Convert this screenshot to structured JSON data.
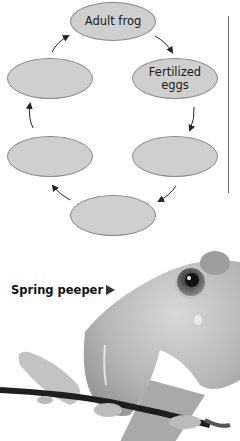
{
  "diagram": {
    "nodes": [
      {
        "id": "adult",
        "label": "Adult frog"
      },
      {
        "id": "eggs",
        "label": "Fertilized\neggs"
      },
      {
        "id": "stage3",
        "label": ""
      },
      {
        "id": "stage4",
        "label": ""
      },
      {
        "id": "stage5",
        "label": ""
      },
      {
        "id": "stage6",
        "label": ""
      }
    ],
    "edges": [
      {
        "from": "adult",
        "to": "eggs"
      },
      {
        "from": "eggs",
        "to": "stage3"
      },
      {
        "from": "stage3",
        "to": "stage4"
      },
      {
        "from": "stage4",
        "to": "stage5"
      },
      {
        "from": "stage5",
        "to": "stage6"
      },
      {
        "from": "stage6",
        "to": "adult"
      }
    ],
    "colors": {
      "node_fill": "#cfcfcf",
      "node_border": "#8a8a8a",
      "arrow": "#222222"
    }
  },
  "photo": {
    "caption": "Spring peeper",
    "caption_pointer": "right-triangle",
    "subject": "grayscale photo of a spring peeper frog perched on a twig"
  }
}
